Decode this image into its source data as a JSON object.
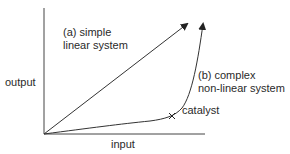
{
  "diagram": {
    "axes": {
      "y_label": "output",
      "x_label": "input"
    },
    "series": [
      {
        "id": "a",
        "label_line1": "(a) simple",
        "label_line2": "linear system",
        "shape": "straight line with arrow"
      },
      {
        "id": "b",
        "label_line1": "(b) complex",
        "label_line2": "non-linear system",
        "shape": "exponential-like curve with arrow"
      }
    ],
    "annotation": {
      "marker": "x",
      "label": "catalyst"
    },
    "colors": {
      "line": "#333333",
      "text": "#2a2a2a",
      "background": "#ffffff"
    }
  }
}
